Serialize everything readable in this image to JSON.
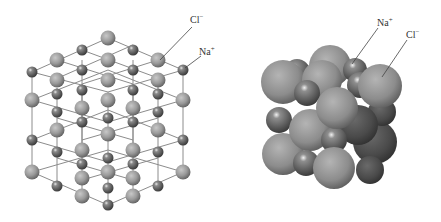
{
  "figure": {
    "models": [
      {
        "id": "ball-and-stick",
        "labels": [
          {
            "ion": "Cl",
            "charge": "−",
            "x": 190,
            "y": 13
          },
          {
            "ion": "Na",
            "charge": "+",
            "x": 199,
            "y": 45
          }
        ]
      },
      {
        "id": "space-filling",
        "labels": [
          {
            "ion": "Na",
            "charge": "+",
            "x": 377,
            "y": 16
          },
          {
            "ion": "Cl",
            "charge": "−",
            "x": 406,
            "y": 28
          }
        ]
      }
    ]
  },
  "colors": {
    "background": "#ffffff",
    "cl_sphere": "#9a9a9a",
    "na_sphere": "#6a6a6a",
    "bond": "#8c8c8c",
    "leader_line": "#444444"
  }
}
